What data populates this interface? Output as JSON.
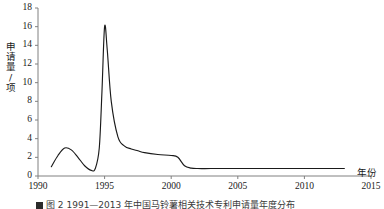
{
  "figure": {
    "background_color": "#ffffff",
    "line_color": "#1a1a1a",
    "axis_color": "#7f7f7f"
  },
  "y_axis": {
    "title": "申请量/项",
    "ticks": [
      0,
      2,
      4,
      6,
      8,
      10,
      12,
      14,
      16,
      18
    ],
    "tick_labels": [
      "0",
      "2",
      "4",
      "6",
      "8",
      "10",
      "12",
      "14",
      "16",
      "18"
    ],
    "min": 0,
    "max": 18
  },
  "x_axis": {
    "title": "年份",
    "ticks": [
      1990,
      1995,
      2000,
      2005,
      2010,
      2015
    ],
    "tick_labels": [
      "1990",
      "1995",
      "2000",
      "2005",
      "2010",
      "2015"
    ],
    "min": 1990,
    "max": 2015
  },
  "caption": {
    "marker": "",
    "text": "图 2  1991—2013 年中国马铃薯相关技术专利申请量年度分布"
  },
  "chart_data": {
    "type": "line",
    "title": "",
    "xlabel": "年份",
    "ylabel": "申请量/项",
    "xlim": [
      1990,
      2015
    ],
    "ylim": [
      0,
      18
    ],
    "grid": false,
    "legend": false,
    "x": [
      1991,
      1991.5,
      1992,
      1992.5,
      1993,
      1993.5,
      1994,
      1994.3,
      1994.6,
      1994.8,
      1995,
      1995.2,
      1995.5,
      1996,
      1996.5,
      1997,
      1997.5,
      1998,
      1999,
      2000,
      2000.5,
      2001,
      2001.5,
      2002,
      2003,
      2005,
      2007,
      2009,
      2011,
      2013
    ],
    "values": [
      1.0,
      2.2,
      3.0,
      2.8,
      2.0,
      1.1,
      0.6,
      0.8,
      3.0,
      9.0,
      16.0,
      13.5,
      8.0,
      4.2,
      3.2,
      2.9,
      2.7,
      2.5,
      2.3,
      2.2,
      2.0,
      1.1,
      0.85,
      0.8,
      0.8,
      0.8,
      0.8,
      0.8,
      0.8,
      0.8
    ],
    "series": [
      {
        "name": "申请量",
        "values": [
          1.0,
          2.2,
          3.0,
          2.8,
          2.0,
          1.1,
          0.6,
          0.8,
          3.0,
          9.0,
          16.0,
          13.5,
          8.0,
          4.2,
          3.2,
          2.9,
          2.7,
          2.5,
          2.3,
          2.2,
          2.0,
          1.1,
          0.85,
          0.8,
          0.8,
          0.8,
          0.8,
          0.8,
          0.8,
          0.8
        ]
      }
    ],
    "peak": {
      "x": 1995,
      "y": 16
    }
  }
}
